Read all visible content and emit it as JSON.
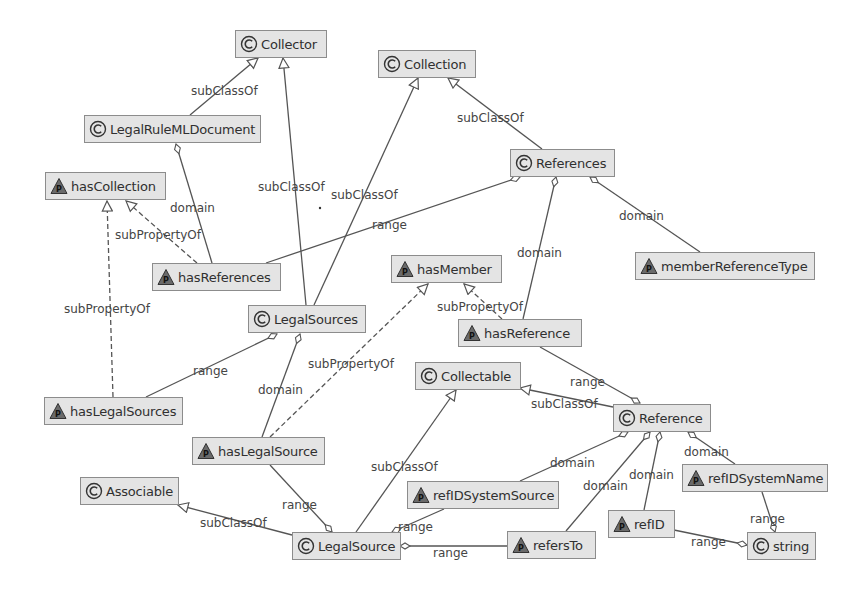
{
  "diagram": {
    "type": "ontology-graph",
    "nodes": {
      "collector": {
        "label": "Collector",
        "kind": "class"
      },
      "collection": {
        "label": "Collection",
        "kind": "class"
      },
      "legalRuleMLDocument": {
        "label": "LegalRuleMLDocument",
        "kind": "class"
      },
      "references": {
        "label": "References",
        "kind": "class"
      },
      "hasCollection": {
        "label": "hasCollection",
        "kind": "property"
      },
      "hasReferences": {
        "label": "hasReferences",
        "kind": "property"
      },
      "memberReferenceType": {
        "label": "memberReferenceType",
        "kind": "property"
      },
      "hasMember": {
        "label": "hasMember",
        "kind": "property"
      },
      "legalSources": {
        "label": "LegalSources",
        "kind": "class"
      },
      "hasReference": {
        "label": "hasReference",
        "kind": "property"
      },
      "hasLegalSources": {
        "label": "hasLegalSources",
        "kind": "property"
      },
      "collectable": {
        "label": "Collectable",
        "kind": "class"
      },
      "reference": {
        "label": "Reference",
        "kind": "class"
      },
      "hasLegalSource": {
        "label": "hasLegalSource",
        "kind": "property"
      },
      "associable": {
        "label": "Associable",
        "kind": "class"
      },
      "refIDSystemSource": {
        "label": "refIDSystemSource",
        "kind": "property"
      },
      "refIDSystemName": {
        "label": "refIDSystemName",
        "kind": "property"
      },
      "legalSource": {
        "label": "LegalSource",
        "kind": "class"
      },
      "refersTo": {
        "label": "refersTo",
        "kind": "property"
      },
      "refID": {
        "label": "refID",
        "kind": "property"
      },
      "string": {
        "label": "string",
        "kind": "class"
      }
    },
    "edge_labels": {
      "e1": "subClassOf",
      "e2": "subClassOf",
      "e3": "domain",
      "e4": "subPropertyOf",
      "e5": "subClassOf",
      "e6": "subClassOf",
      "e7": "range",
      "e8": "domain",
      "e9": "domain",
      "e10": "subPropertyOf",
      "e11": "subPropertyOf",
      "e12": "range",
      "e13": "domain",
      "e14": "subPropertyOf",
      "e15": "range",
      "e16": "subClassOf",
      "e17": "domain",
      "e18": "domain",
      "e19": "domain",
      "e20": "domain",
      "e21": "subClassOf",
      "e22": "range",
      "e23": "subClassOf",
      "e24": "range",
      "e25": "range",
      "e26": "range",
      "e27": "range"
    },
    "icons": {
      "class": "class-c-icon",
      "property": "property-p-triangle-icon"
    },
    "colors": {
      "node_fill": "#e4e4e4",
      "node_border": "#8c8c8c",
      "edge": "#555555",
      "text": "#303030"
    }
  }
}
